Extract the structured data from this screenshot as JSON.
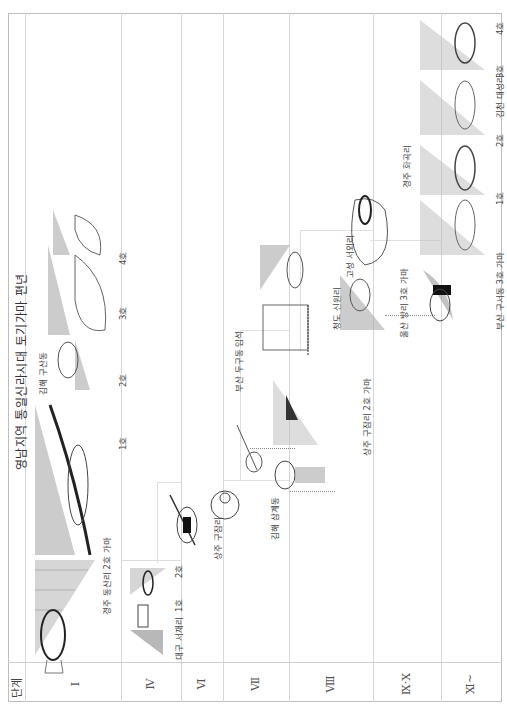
{
  "title": "영남지역 통일신라시대 토기가마 편년",
  "header_label": "단계",
  "stages": [
    {
      "label": "Ⅰ",
      "x": 75
    },
    {
      "label": "Ⅳ",
      "x": 180
    },
    {
      "label": "Ⅵ",
      "x": 227
    },
    {
      "label": "Ⅶ",
      "x": 289
    },
    {
      "label": "Ⅷ",
      "x": 355
    },
    {
      "label": "Ⅸ·Ⅹ",
      "x": 423
    },
    {
      "label": "Ⅺ~",
      "x": 471
    }
  ],
  "sites": [
    {
      "name": "경주 동산리 2호 가마",
      "stage": "Ⅰ"
    },
    {
      "name": "김해 구산동",
      "stage": "Ⅰ",
      "kilns": [
        "1호",
        "2호",
        "3호",
        "4호"
      ]
    },
    {
      "name": "대구 서재리",
      "stage": "Ⅳ",
      "kilns": [
        "1호",
        "2호"
      ]
    },
    {
      "name": "상주 구잠리",
      "stage": "Ⅵ"
    },
    {
      "name": "김해 삼계동",
      "stage": "Ⅶ"
    },
    {
      "name": "부산 두구동 임석",
      "stage": "Ⅶ"
    },
    {
      "name": "상주 구잠리 2호 가마",
      "stage": "Ⅷ"
    },
    {
      "name": "청도 신원리",
      "stage": "Ⅷ"
    },
    {
      "name": "고성 서외리",
      "stage": "Ⅷ"
    },
    {
      "name": "울산 방리 3호 가마",
      "stage": "Ⅸ·Ⅹ"
    },
    {
      "name": "경주 화곡리",
      "stage": "Ⅸ·Ⅹ",
      "kilns": [
        "1호",
        "2호"
      ]
    },
    {
      "name": "부산 구서동 3호 가마",
      "stage": "Ⅺ~"
    },
    {
      "name": "김천 대성리",
      "stage": "Ⅺ~",
      "kilns": [
        "3호",
        "4호"
      ]
    }
  ],
  "colors": {
    "line": "#d6d6d6",
    "frame": "#bdbdbd",
    "drawing": "#555555",
    "shade": "#999999"
  }
}
